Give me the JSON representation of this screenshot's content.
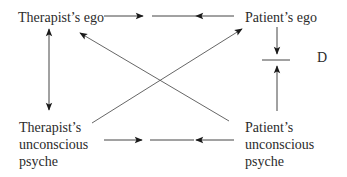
{
  "diagram": {
    "nodes": {
      "therapist_ego": {
        "lines": [
          "Therapist’s ego"
        ]
      },
      "patient_ego": {
        "lines": [
          "Patient’s ego"
        ]
      },
      "therapist_unconscious": {
        "lines": [
          "Therapist’s",
          "unconscious",
          "psyche"
        ]
      },
      "patient_unconscious": {
        "lines": [
          "Patient’s",
          "unconscious",
          "psyche"
        ]
      }
    },
    "barrier_label": "D",
    "edges": [
      {
        "from": "Therapist’s ego",
        "to": "barrier (top)",
        "type": "arrow-blocked"
      },
      {
        "from": "Patient’s ego",
        "to": "barrier (top)",
        "type": "arrow-blocked"
      },
      {
        "from": "Therapist’s unconscious psyche",
        "to": "barrier (bottom)",
        "type": "arrow-blocked"
      },
      {
        "from": "Patient’s unconscious psyche",
        "to": "barrier (bottom)",
        "type": "arrow-blocked"
      },
      {
        "from": "Therapist’s ego",
        "to": "Therapist’s unconscious psyche",
        "type": "bidirectional"
      },
      {
        "from": "Patient’s ego",
        "to": "D barrier",
        "type": "arrow-to-barrier"
      },
      {
        "from": "Patient’s unconscious psyche",
        "to": "D barrier",
        "type": "arrow-to-barrier"
      },
      {
        "from": "Patient’s unconscious psyche",
        "to": "Therapist’s ego",
        "type": "diagonal-arrow"
      },
      {
        "from": "Therapist’s unconscious psyche",
        "to": "Patient’s ego",
        "type": "diagonal-arrow"
      }
    ]
  }
}
